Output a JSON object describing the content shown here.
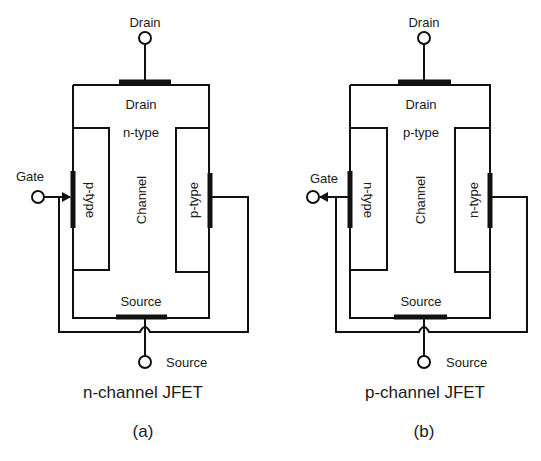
{
  "figure": {
    "panels": [
      {
        "id": "a",
        "caption": "n-channel JFET",
        "sublabel": "(a)",
        "drain_terminal": "Drain",
        "drain_region": "Drain",
        "channel_type": "n-type",
        "channel_label": "Channel",
        "gate_left_type": "p-type",
        "gate_right_type": "p-type",
        "gate_terminal": "Gate",
        "gate_arrow_direction": "inward",
        "source_region": "Source",
        "source_terminal": "Source"
      },
      {
        "id": "b",
        "caption": "p-channel JFET",
        "sublabel": "(b)",
        "drain_terminal": "Drain",
        "drain_region": "Drain",
        "channel_type": "p-type",
        "channel_label": "Channel",
        "gate_left_type": "n-type",
        "gate_right_type": "n-type",
        "gate_terminal": "Gate",
        "gate_arrow_direction": "outward",
        "source_region": "Source",
        "source_terminal": "Source"
      }
    ],
    "colors": {
      "line": "#111111",
      "text": "#1a1a1a",
      "background": "#ffffff"
    }
  }
}
